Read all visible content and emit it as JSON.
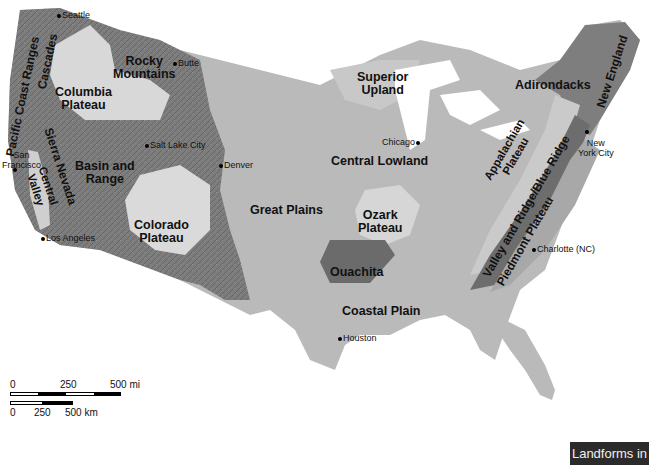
{
  "map": {
    "title": "Landforms in",
    "colors": {
      "background": "#ffffff",
      "lowland": "#b9b9b9",
      "mountains": "#7f7f7f",
      "plateau": "#dcdcdc",
      "ouachita": "#6e6e6e",
      "title_box": "#2b2b2b"
    },
    "regions": [
      {
        "name": "Pacific Coast Ranges"
      },
      {
        "name": "Cascades"
      },
      {
        "name": "Rocky Mountains"
      },
      {
        "name": "Columbia Plateau"
      },
      {
        "name": "Sierra Nevada"
      },
      {
        "name": "Central Valley"
      },
      {
        "name": "Basin and Range"
      },
      {
        "name": "Colorado Plateau"
      },
      {
        "name": "Great Plains"
      },
      {
        "name": "Superior Upland"
      },
      {
        "name": "Central Lowland"
      },
      {
        "name": "Ozark Plateau"
      },
      {
        "name": "Ouachita"
      },
      {
        "name": "Coastal Plain"
      },
      {
        "name": "Adirondacks"
      },
      {
        "name": "New England"
      },
      {
        "name": "Appalachian Plateau"
      },
      {
        "name": "Valley and Ridge/Blue Ridge"
      },
      {
        "name": "Piedmont Plateau"
      }
    ],
    "region_labels": {
      "pacific_coast_ranges": "Pacific Coast Ranges",
      "cascades": "Cascades",
      "rocky_1": "Rocky",
      "rocky_2": "Mountains",
      "columbia_1": "Columbia",
      "columbia_2": "Plateau",
      "sierra_nevada": "Sierra Nevada",
      "central_valley_1": "Central",
      "central_valley_2": "Valley",
      "basin_1": "Basin and",
      "basin_2": "Range",
      "colorado_1": "Colorado",
      "colorado_2": "Plateau",
      "great_plains": "Great Plains",
      "superior_1": "Superior",
      "superior_2": "Upland",
      "central_lowland": "Central Lowland",
      "ozark_1": "Ozark",
      "ozark_2": "Plateau",
      "ouachita": "Ouachita",
      "coastal_plain": "Coastal Plain",
      "adirondacks": "Adirondacks",
      "new_england": "New England",
      "appalachian_1": "Appalachian",
      "appalachian_2": "Plateau",
      "valley_ridge": "Valley and Ridge/Blue Ridge",
      "piedmont": "Piedmont Plateau"
    },
    "cities": {
      "seattle": "Seattle",
      "butte": "Butte",
      "salt_lake_city": "Salt Lake City",
      "denver": "Denver",
      "san_francisco_1": "San",
      "san_francisco_2": "Francisco",
      "los_angeles": "Los Angeles",
      "chicago": "Chicago",
      "new_york_1": "New",
      "new_york_2": "York City",
      "charlotte": "Charlotte (NC)",
      "houston": "Houston"
    },
    "scale_bar": {
      "mi_ticks": [
        "0",
        "250",
        "500 mi"
      ],
      "km_ticks": [
        "0",
        "250",
        "500 km"
      ]
    }
  }
}
